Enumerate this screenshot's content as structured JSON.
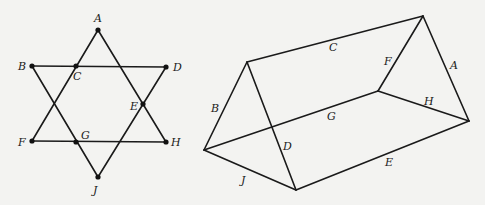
{
  "star": {
    "labels": {
      "A": "A",
      "B": "B",
      "C": "C",
      "D": "D",
      "E": "E",
      "F": "F",
      "G": "G",
      "H": "H",
      "J": "J"
    }
  },
  "prism": {
    "edge_labels": {
      "A": "A",
      "B": "B",
      "C": "C",
      "D": "D",
      "E": "E",
      "F": "F",
      "G": "G",
      "H": "H",
      "J": "J"
    }
  }
}
